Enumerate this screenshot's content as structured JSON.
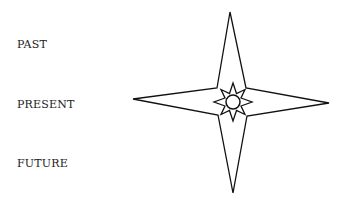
{
  "labels": [
    "PAST",
    "PRESENT",
    "FUTURE"
  ],
  "figure": {
    "stroke_color": "#111111",
    "fill_color": "#ffffff"
  }
}
